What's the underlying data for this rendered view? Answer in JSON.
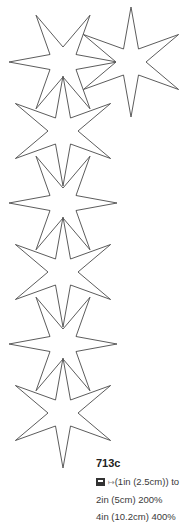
{
  "figure": {
    "label": "713c",
    "scale_icon": "photocopy-icon",
    "arrow_glyph": "↦",
    "line1": "(1in (2.5cm)) to",
    "line2": "2in (5cm) 200%",
    "line3": "4in (10.2cm) 400%",
    "stroke_color": "#4a4a4a",
    "background_color": "#ffffff"
  },
  "stars": [
    {
      "cx": 63,
      "cy": 62,
      "r": 54,
      "ri": 15,
      "orientation": "horizontal"
    },
    {
      "cx": 131,
      "cy": 62,
      "r": 55,
      "ri": 15,
      "orientation": "vertical"
    },
    {
      "cx": 63,
      "cy": 131,
      "r": 55,
      "ri": 15,
      "orientation": "vertical"
    },
    {
      "cx": 63,
      "cy": 203,
      "r": 54,
      "ri": 15,
      "orientation": "horizontal"
    },
    {
      "cx": 63,
      "cy": 272,
      "r": 55,
      "ri": 15,
      "orientation": "vertical"
    },
    {
      "cx": 63,
      "cy": 344,
      "r": 54,
      "ri": 15,
      "orientation": "horizontal"
    },
    {
      "cx": 63,
      "cy": 413,
      "r": 55,
      "ri": 15,
      "orientation": "vertical"
    }
  ]
}
